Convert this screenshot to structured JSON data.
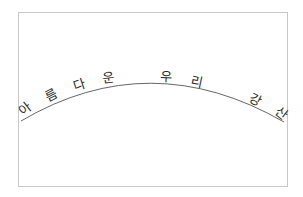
{
  "text": "아름다운 우리 강산",
  "characters": [
    {
      "char": "아",
      "x": 25,
      "y": 113,
      "rotate": -38
    },
    {
      "char": "름",
      "x": 51,
      "y": 100,
      "rotate": -28
    },
    {
      "char": "다",
      "x": 79,
      "y": 89,
      "rotate": -18
    },
    {
      "char": "운",
      "x": 108,
      "y": 82,
      "rotate": -7
    },
    {
      "char": "우",
      "x": 166,
      "y": 81,
      "rotate": 3
    },
    {
      "char": "리",
      "x": 197,
      "y": 86,
      "rotate": 12
    },
    {
      "char": "강",
      "x": 256,
      "y": 104,
      "rotate": 27
    },
    {
      "char": "산",
      "x": 282,
      "y": 118,
      "rotate": 38
    }
  ],
  "colors": {
    "border": "#c8c8c8",
    "arc": "#555555",
    "text": "#2a2a2a"
  }
}
